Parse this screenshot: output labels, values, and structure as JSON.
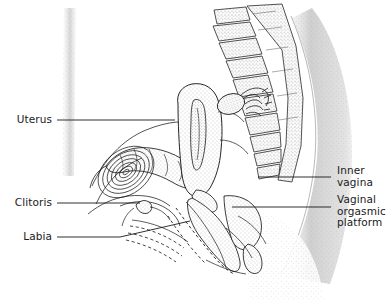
{
  "figure": {
    "background_color": "#ffffff",
    "line_color": "#1a1a1a",
    "stipple_color": "#9a9a9a",
    "text_color": "#1a1a1a",
    "width": 391,
    "height": 307
  },
  "labels": {
    "uterus": "Uterus",
    "clitoris": "Clitoris",
    "labia": "Labia",
    "inner_vagina": "Inner\nvagina",
    "vaginal_orgasmic_platform": "Vaginal\norgasmic\nplatform"
  },
  "structures": [
    {
      "name": "sacrum-vertebrae",
      "side": "upper-right",
      "rendering": "outlined segments with stippled bone texture"
    },
    {
      "name": "uterus",
      "side": "center",
      "rendering": "outlined organ with stippled interior and endometrial cavity"
    },
    {
      "name": "ovary",
      "side": "upper-right-of-uterus",
      "rendering": "small stippled oval"
    },
    {
      "name": "fallopian-tube-fimbriae",
      "side": "right-of-ovary",
      "rendering": "coiled fringed tube"
    },
    {
      "name": "bladder",
      "side": "left-of-uterus",
      "rendering": "concentric contour lines"
    },
    {
      "name": "rectum-colon",
      "side": "left-center",
      "rendering": "haustrated sacculated tube"
    },
    {
      "name": "vaginal-canal",
      "side": "lower-center",
      "rendering": "stippled channel outlined with dashed aroused-state contour"
    },
    {
      "name": "clitoris",
      "side": "lower-left",
      "rendering": "small bulb at pubic arch"
    },
    {
      "name": "labia",
      "side": "bottom-left",
      "rendering": "dashed folds below vaginal opening"
    },
    {
      "name": "anal-canal",
      "side": "lower-right",
      "rendering": "short stippled tube"
    },
    {
      "name": "abdominal-wall",
      "side": "far-left",
      "rendering": "faint vertical stipple band"
    },
    {
      "name": "buttock-contour",
      "side": "far-right",
      "rendering": "broad stippled gradient band"
    }
  ],
  "leader_lines": [
    {
      "name": "uterus-leader",
      "from": [
        57,
        120
      ],
      "to": [
        175,
        120
      ]
    },
    {
      "name": "clitoris-leader",
      "from": [
        57,
        203
      ],
      "to": [
        140,
        203
      ]
    },
    {
      "name": "labia-leader",
      "from": [
        57,
        237
      ],
      "to": [
        120,
        237
      ],
      "elbow_to": [
        188,
        222
      ]
    },
    {
      "name": "inner-vagina-leader",
      "from": [
        258,
        177
      ],
      "to": [
        331,
        177
      ]
    },
    {
      "name": "vaginal-platform-leader",
      "from": [
        232,
        207
      ],
      "to": [
        331,
        207
      ]
    }
  ]
}
